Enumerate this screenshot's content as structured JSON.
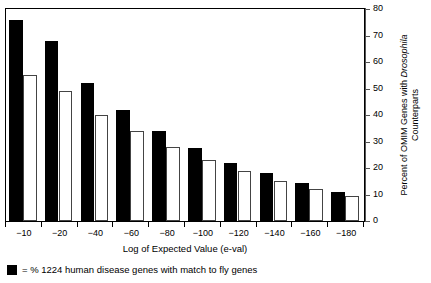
{
  "chart_data": {
    "type": "bar",
    "title": "",
    "xlabel": "Log of Expected Value (e-val)",
    "ylabel": "Percent of OMIM Genes with Drosophila Counterparts",
    "ylabel_line1": "Percent of OMIM Genes with ",
    "ylabel_italic": "Drosophila",
    "ylabel_line2": "Counterparts",
    "categories": [
      "−10",
      "−20",
      "−40",
      "−60",
      "−80",
      "−100",
      "−120",
      "−140",
      "−160",
      "−180"
    ],
    "ylim": [
      0,
      80
    ],
    "yticks": [
      0,
      10,
      20,
      30,
      40,
      50,
      60,
      70,
      80
    ],
    "ytick_labels": [
      "0",
      "10",
      "20",
      "30",
      "40",
      "50",
      "60",
      "70",
      "80"
    ],
    "grid": false,
    "legend_position": "below-plot",
    "series": [
      {
        "name": "% 1224 human disease genes with match to fly genes",
        "style": "filled-black",
        "color": "#000000",
        "values": [
          76,
          68,
          52,
          42,
          34,
          27.5,
          22,
          18,
          14.5,
          11
        ]
      },
      {
        "name": "unlabeled second series (open bars)",
        "style": "open-white",
        "color": "#ffffff",
        "values": [
          55,
          49,
          40,
          34,
          28,
          23,
          19,
          15,
          12,
          9.5
        ]
      }
    ]
  },
  "axis": {
    "y_title_prefix": "Percent of OMIM Genes with ",
    "y_title_italic": "Drosophila",
    "y_title_suffix": "Counterparts",
    "x_title": "Log of Expected Value (e-val)"
  },
  "legend": {
    "swatch_name": "black-square-swatch",
    "text": "= % 1224 human disease genes with match to fly genes"
  }
}
